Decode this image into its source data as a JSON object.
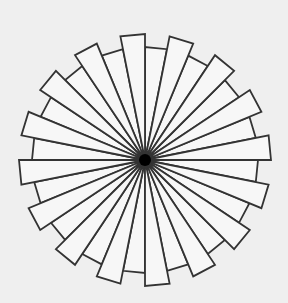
{
  "figure": {
    "type": "radial-pinwheel",
    "background": "#efefef",
    "stroke": "#333333",
    "fill": "#f7f7f7",
    "center": {
      "x": 145,
      "y": 160
    },
    "hub_radius": 6,
    "wedge_count": 32,
    "wedge_angle_deg": 11.25,
    "long_radius": 126,
    "short_radius": 113,
    "long_start_offset_deg": -11.25
  }
}
